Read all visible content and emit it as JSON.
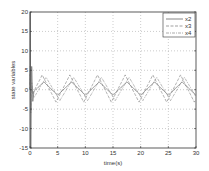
{
  "chart_data": {
    "type": "line",
    "title": "",
    "xlabel": "time(s)",
    "ylabel": "state variables",
    "xlim": [
      0,
      30
    ],
    "ylim": [
      -15,
      20
    ],
    "xticks": [
      0,
      5,
      10,
      15,
      20,
      25,
      30
    ],
    "yticks": [
      -15,
      -10,
      -5,
      0,
      5,
      10,
      15,
      20
    ],
    "grid": true,
    "legend_position": "upper right",
    "series": [
      {
        "name": "x2",
        "style": "solid",
        "color": "#555555",
        "amplitude": 1.7,
        "offset": 0.3,
        "period": 5.0,
        "phase": 0.0,
        "initial_spike": [
          20,
          -15
        ]
      },
      {
        "name": "x3",
        "style": "dashed",
        "color": "#777777",
        "amplitude": 3.5,
        "offset": 0.3,
        "period": 5.0,
        "phase": 0.3,
        "initial_spike": [
          6,
          -6
        ]
      },
      {
        "name": "x4",
        "style": "dashdot",
        "color": "#888888",
        "amplitude": 3.0,
        "offset": 0.2,
        "period": 5.0,
        "phase": -0.4,
        "initial_spike": [
          4,
          -5
        ]
      }
    ]
  },
  "legend": {
    "items": [
      "x2",
      "x3",
      "x4"
    ]
  }
}
